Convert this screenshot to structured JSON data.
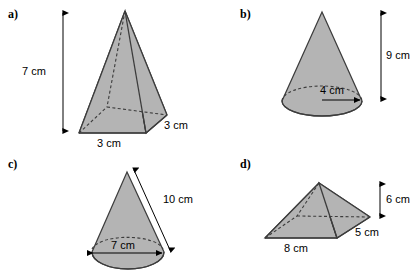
{
  "figure": {
    "type": "geometry-solids-exercise",
    "background_color": "#ffffff",
    "solid_fill_color": "#b4b4b4",
    "outline_color": "#3c3c3c",
    "hidden_edge_style": "dashed",
    "units": "cm",
    "panel_count": 4
  },
  "panels": [
    {
      "id": "a",
      "label": "a)",
      "shape": "square-based pyramid",
      "dimensions": [
        {
          "name": "height",
          "value": 7,
          "unit": "cm",
          "text": "7 cm",
          "arrow": "double-headed-vertical"
        },
        {
          "name": "base-front-edge",
          "value": 3,
          "unit": "cm",
          "text": "3 cm",
          "arrow": "none"
        },
        {
          "name": "base-side-edge",
          "value": 3,
          "unit": "cm",
          "text": "3 cm",
          "arrow": "none"
        }
      ]
    },
    {
      "id": "b",
      "label": "b)",
      "shape": "cone",
      "dimensions": [
        {
          "name": "height",
          "value": 9,
          "unit": "cm",
          "text": "9 cm",
          "arrow": "double-headed-vertical"
        },
        {
          "name": "base-radius",
          "value": 4,
          "unit": "cm",
          "text": "4 cm",
          "arrow": "single-headed-right"
        }
      ]
    },
    {
      "id": "c",
      "label": "c)",
      "shape": "cone",
      "dimensions": [
        {
          "name": "slant-height",
          "value": 10,
          "unit": "cm",
          "text": "10 cm",
          "arrow": "double-headed-diagonal"
        },
        {
          "name": "base-diameter",
          "value": 7,
          "unit": "cm",
          "text": "7 cm",
          "arrow": "double-headed-horizontal"
        }
      ]
    },
    {
      "id": "d",
      "label": "d)",
      "shape": "rectangular-based pyramid",
      "dimensions": [
        {
          "name": "height",
          "value": 6,
          "unit": "cm",
          "text": "6 cm",
          "arrow": "double-headed-vertical"
        },
        {
          "name": "base-front-edge",
          "value": 8,
          "unit": "cm",
          "text": "8 cm",
          "arrow": "none"
        },
        {
          "name": "base-side-edge",
          "value": 5,
          "unit": "cm",
          "text": "5 cm",
          "arrow": "none"
        }
      ]
    }
  ]
}
